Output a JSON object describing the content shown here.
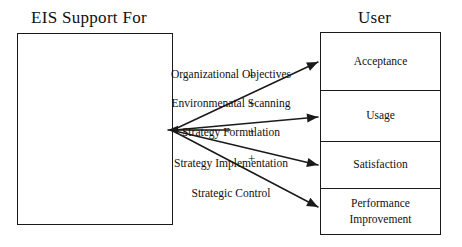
{
  "diagram": {
    "left": {
      "title": "EIS Support For",
      "items": [
        {
          "label": "Organizational Objectives",
          "y": 68
        },
        {
          "label": "Environmenatal Scanning",
          "y": 97
        },
        {
          "label": "Strategy Formulation",
          "y": 126
        },
        {
          "label": "Strategy Implementation",
          "y": 157
        },
        {
          "label": "Strategic Control",
          "y": 187
        }
      ]
    },
    "right": {
      "title": "User",
      "cells": [
        {
          "label": "Acceptance",
          "top": 0,
          "height": 57
        },
        {
          "label": "Usage",
          "top": 57,
          "height": 51
        },
        {
          "label": "Satisfaction",
          "top": 108,
          "height": 47
        },
        {
          "label": "Performance\nImprovement",
          "top": 155,
          "height": 48
        }
      ]
    },
    "connectors": {
      "origin": {
        "x": 173,
        "y": 130
      },
      "arrows": [
        {
          "id": "arrow-acceptance",
          "x1": 175,
          "y1": 129,
          "x2": 318,
          "y2": 62,
          "target": "Acceptance"
        },
        {
          "id": "arrow-usage",
          "x1": 175,
          "y1": 130,
          "x2": 318,
          "y2": 117,
          "target": "Usage"
        },
        {
          "id": "arrow-satisfaction",
          "x1": 175,
          "y1": 131,
          "x2": 318,
          "y2": 165,
          "target": "Satisfaction"
        },
        {
          "id": "arrow-performance",
          "x1": 175,
          "y1": 132,
          "x2": 318,
          "y2": 207,
          "target": "Performance Improvement"
        }
      ],
      "feedback_arrow": {
        "id": "arrow-feedback",
        "x1": 230,
        "y1": 130,
        "x2": 168,
        "y2": 130
      },
      "signs": [
        {
          "symbol": "+",
          "x": 248,
          "y": 69
        },
        {
          "symbol": "+",
          "x": 248,
          "y": 97
        },
        {
          "symbol": "+",
          "x": 248,
          "y": 125
        },
        {
          "symbol": "+",
          "x": 248,
          "y": 152
        }
      ]
    },
    "colors": {
      "stroke": "#1a1a1a",
      "text": "#111111",
      "background": "#ffffff"
    }
  }
}
